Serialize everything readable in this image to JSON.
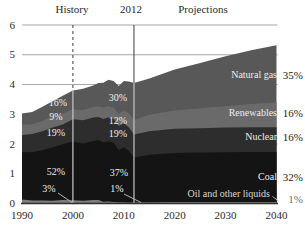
{
  "figure": {
    "header": {
      "history": "History",
      "divider_year": "2012",
      "projections": "Projections"
    }
  },
  "axes": {
    "y_ticks": [
      "6",
      "5",
      "4",
      "3",
      "2",
      "1",
      "0"
    ],
    "x_ticks": [
      "1990",
      "2000",
      "2010",
      "2020",
      "2030",
      "2040"
    ],
    "ylim": [
      0,
      6
    ],
    "xlim": [
      1990,
      2040
    ]
  },
  "colors": {
    "background": "#ffffff",
    "grid": "#8f8f8f",
    "axis": "#2e2e2e",
    "text": "#2a2a2a",
    "inner_label": "#ededed",
    "oil_label": "#d9d9d9",
    "muted_pct": "#6f6f6f",
    "divider_dark": "#3c3c3c",
    "divider_light": "#c6c6c6",
    "leader": "#b5b5b5"
  },
  "chart_data": {
    "type": "area",
    "stacked": true,
    "title": "",
    "xlabel": "",
    "ylabel": "",
    "ylim": [
      0,
      6
    ],
    "grid": true,
    "history_divider_year": 2000,
    "present_divider_year": 2012,
    "x": [
      1990,
      1992,
      1994,
      1996,
      1998,
      2000,
      2002,
      2004,
      2005,
      2006,
      2007,
      2008,
      2009,
      2010,
      2011,
      2012,
      2015,
      2020,
      2025,
      2030,
      2035,
      2040
    ],
    "series": [
      {
        "key": "oil",
        "name": "Oil and other liquids",
        "share_2040": "1%",
        "inner_2000": "3%",
        "inner_2012": "1%",
        "color": "#7d7d7d",
        "values": [
          0.13,
          0.1,
          0.1,
          0.09,
          0.12,
          0.11,
          0.09,
          0.12,
          0.12,
          0.06,
          0.07,
          0.05,
          0.04,
          0.04,
          0.03,
          0.04,
          0.04,
          0.05,
          0.05,
          0.05,
          0.05,
          0.05
        ]
      },
      {
        "key": "coal",
        "name": "Coal",
        "share_2040": "32%",
        "inner_2000": "52%",
        "inner_2012": "37%",
        "color": "#141414",
        "values": [
          1.59,
          1.62,
          1.69,
          1.79,
          1.87,
          1.97,
          1.93,
          1.98,
          2.01,
          1.99,
          2.02,
          1.99,
          1.76,
          1.85,
          1.73,
          1.51,
          1.6,
          1.65,
          1.66,
          1.67,
          1.68,
          1.68
        ]
      },
      {
        "key": "nuclear",
        "name": "Nuclear",
        "share_2040": "16%",
        "inner_2000": "19%",
        "inner_2012": "19%",
        "color": "#2d2d2d",
        "values": [
          0.58,
          0.62,
          0.64,
          0.67,
          0.67,
          0.75,
          0.78,
          0.79,
          0.78,
          0.79,
          0.81,
          0.81,
          0.8,
          0.81,
          0.79,
          0.77,
          0.79,
          0.81,
          0.82,
          0.83,
          0.83,
          0.83
        ]
      },
      {
        "key": "renewables",
        "name": "Renewables",
        "share_2040": "16%",
        "inner_2000": "9%",
        "inner_2012": "12%",
        "color": "#6a6a6a",
        "values": [
          0.36,
          0.32,
          0.34,
          0.39,
          0.36,
          0.34,
          0.34,
          0.35,
          0.36,
          0.39,
          0.37,
          0.38,
          0.42,
          0.43,
          0.48,
          0.49,
          0.55,
          0.62,
          0.67,
          0.72,
          0.78,
          0.83
        ]
      },
      {
        "key": "natural_gas",
        "name": "Natural gas",
        "share_2040": "35%",
        "inner_2000": "16%",
        "inner_2012": "30%",
        "color": "#585858",
        "values": [
          0.37,
          0.42,
          0.48,
          0.5,
          0.6,
          0.63,
          0.72,
          0.73,
          0.78,
          0.83,
          0.89,
          0.89,
          0.93,
          0.99,
          1.07,
          1.24,
          1.22,
          1.37,
          1.52,
          1.68,
          1.81,
          1.93
        ]
      }
    ]
  }
}
